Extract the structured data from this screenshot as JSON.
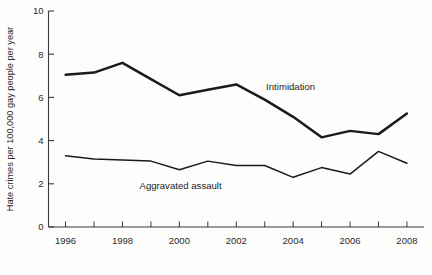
{
  "chart_data": {
    "type": "line",
    "title": "",
    "xlabel": "",
    "ylabel": "Hate crimes per 100,000 gay people per year",
    "xlim": [
      1995.4,
      2008.6
    ],
    "ylim": [
      0,
      10
    ],
    "grid": false,
    "legend_position": "inline-annotation",
    "x": [
      1996,
      1997,
      1998,
      1999,
      2000,
      2001,
      2002,
      2003,
      2004,
      2005,
      2006,
      2007,
      2008
    ],
    "x_tick_values": [
      1996,
      1997,
      1998,
      1999,
      2000,
      2001,
      2002,
      2003,
      2004,
      2005,
      2006,
      2007,
      2008
    ],
    "x_tick_labels": [
      "1996",
      "",
      "1998",
      "",
      "2000",
      "",
      "2002",
      "",
      "2004",
      "",
      "2006",
      "",
      "2008"
    ],
    "y_tick_values": [
      0,
      2,
      4,
      6,
      8,
      10
    ],
    "y_tick_labels": [
      "0",
      "2",
      "4",
      "6",
      "8",
      "10"
    ],
    "series": [
      {
        "name": "Intimidation",
        "label": "Intimidation",
        "label_x": 2003.05,
        "label_y": 6.35,
        "color": "#1a1a1a",
        "width": 2.5,
        "values": [
          7.05,
          7.15,
          7.6,
          6.85,
          6.1,
          6.35,
          6.6,
          5.9,
          5.1,
          4.15,
          4.45,
          4.3,
          5.25
        ]
      },
      {
        "name": "Aggravated assault",
        "label": "Aggravated assault",
        "label_x": 1998.6,
        "label_y": 1.75,
        "color": "#1a1a1a",
        "width": 1.5,
        "values": [
          3.3,
          3.15,
          3.1,
          3.05,
          2.65,
          3.05,
          2.85,
          2.85,
          2.3,
          2.75,
          2.45,
          3.5,
          2.95
        ]
      }
    ]
  }
}
